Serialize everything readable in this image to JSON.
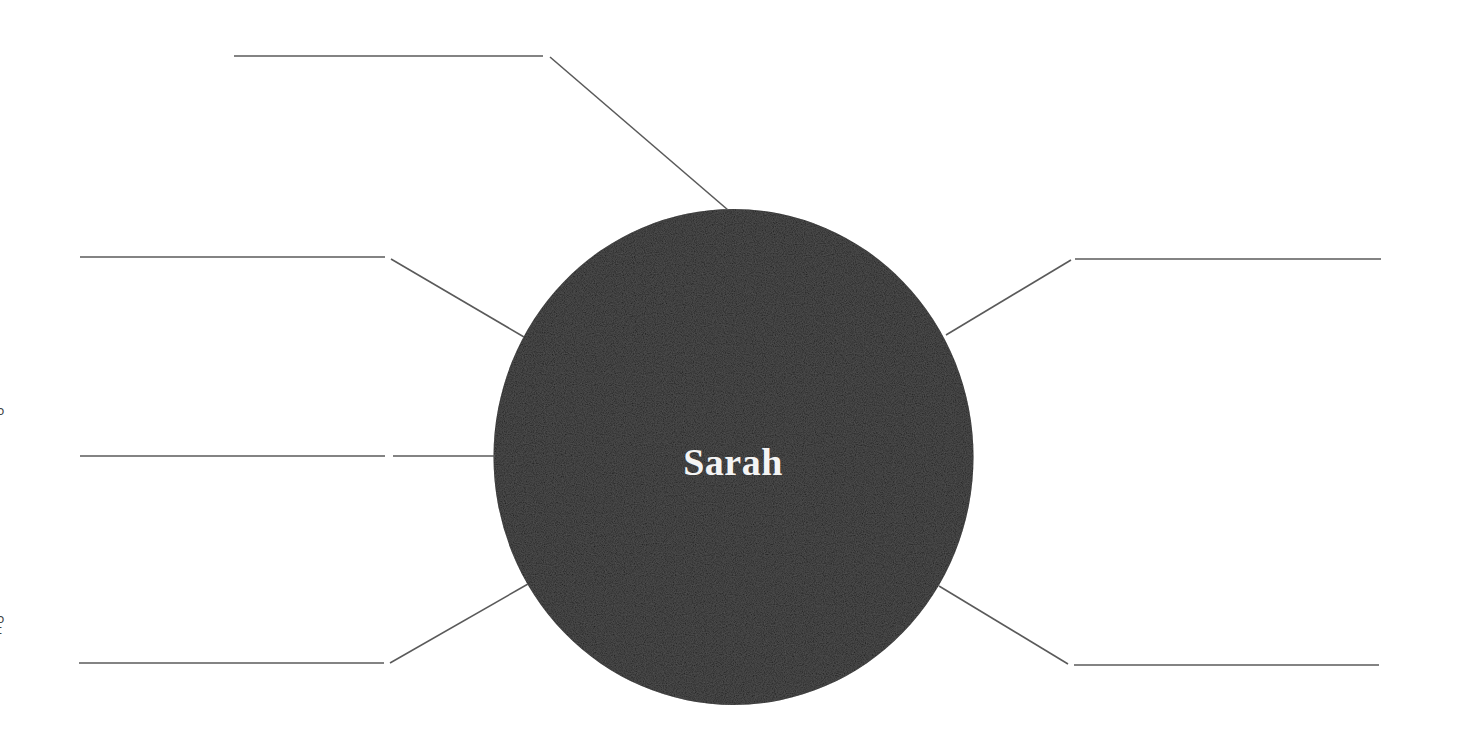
{
  "worksheet": {
    "type": "character web / mind map",
    "center_node": {
      "label": "Sarah",
      "fill_color": "#1b1b1b",
      "text_color": "#f4f4f4"
    },
    "line_color": "#5a5a5a",
    "answer_lines": [
      {
        "id": "top-left",
        "text": ""
      },
      {
        "id": "left-upper",
        "text": ""
      },
      {
        "id": "left-middle",
        "text": ""
      },
      {
        "id": "left-lower",
        "text": ""
      },
      {
        "id": "right-upper",
        "text": ""
      },
      {
        "id": "right-lower",
        "text": ""
      }
    ],
    "edge_marks": [
      "o",
      "o",
      "t"
    ]
  }
}
